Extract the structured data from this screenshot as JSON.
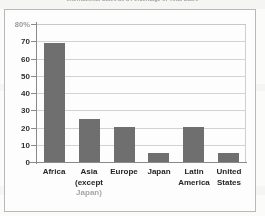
{
  "document": {
    "title": "International Sales as a Percentage of Total Sales",
    "paper_color": "#fbfbfa",
    "frame_color": "#b9b9b9",
    "bar_color": "#6f6f6f",
    "grid_color": "#d2d2d2",
    "axis_color": "#8a8a8a"
  },
  "chart_data": {
    "type": "bar",
    "title": "International Sales as a Percentage of Total Sales",
    "xlabel": "",
    "ylabel": "",
    "categories": [
      "Africa",
      "Asia (except Japan)",
      "Europe",
      "Japan",
      "Latin America",
      "United States"
    ],
    "category_lines": [
      [
        "Africa"
      ],
      [
        "Asia",
        "(except",
        "Japan)"
      ],
      [
        "Europe"
      ],
      [
        "Japan"
      ],
      [
        "Latin",
        "America"
      ],
      [
        "United",
        "States"
      ]
    ],
    "values": [
      69,
      25,
      20,
      5,
      20,
      5
    ],
    "ylim": [
      0,
      80
    ],
    "ytick_labels": [
      "80%",
      "70",
      "60",
      "50",
      "40",
      "30",
      "20",
      "10",
      "0"
    ],
    "ytick_values": [
      80,
      70,
      60,
      50,
      40,
      30,
      20,
      10,
      0
    ],
    "grid": true,
    "legend": "none",
    "units": "percent"
  }
}
